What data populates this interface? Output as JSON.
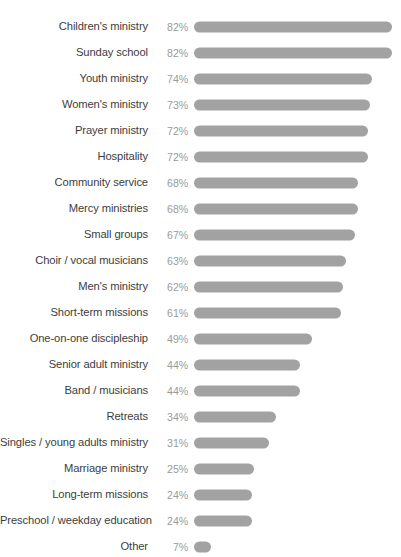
{
  "chart_data": {
    "type": "bar",
    "orientation": "horizontal",
    "title": "",
    "subtitle": "",
    "xlabel": "",
    "ylabel": "",
    "xlim": [
      0,
      100
    ],
    "grid": false,
    "legend": false,
    "value_suffix": "%",
    "bar_color": "#a2a2a2",
    "label_color": "#3d3d3d",
    "value_color": "#9b9b9b",
    "background_color": "#ffffff",
    "categories": [
      "Children's ministry",
      "Sunday school",
      "Youth ministry",
      "Women's ministry",
      "Prayer ministry",
      "Hospitality",
      "Community service",
      "Mercy ministries",
      "Small groups",
      "Choir / vocal musicians",
      "Men's ministry",
      "Short-term missions",
      "One-on-one discipleship",
      "Senior adult ministry",
      "Band / musicians",
      "Retreats",
      "Singles / young adults ministry",
      "Marriage ministry",
      "Long-term missions",
      "Preschool / weekday education",
      "Other"
    ],
    "values": [
      82,
      82,
      74,
      73,
      72,
      72,
      68,
      68,
      67,
      63,
      62,
      61,
      49,
      44,
      44,
      34,
      31,
      25,
      24,
      24,
      7
    ],
    "value_labels": [
      "82%",
      "82%",
      "74%",
      "73%",
      "72%",
      "72%",
      "68%",
      "68%",
      "67%",
      "63%",
      "62%",
      "61%",
      "49%",
      "44%",
      "44%",
      "34%",
      "31%",
      "25%",
      "24%",
      "24%",
      "7%"
    ]
  }
}
